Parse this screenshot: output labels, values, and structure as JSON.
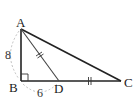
{
  "figure": {
    "vertices": {
      "A": {
        "label": "A",
        "x": 21,
        "y": 29
      },
      "B": {
        "label": "B",
        "x": 21,
        "y": 81
      },
      "C": {
        "label": "C",
        "x": 121,
        "y": 81
      },
      "D": {
        "label": "D",
        "x": 59,
        "y": 81
      }
    },
    "measures": {
      "AB": "8",
      "BD": "6"
    },
    "equal_marks": [
      "AD",
      "DC"
    ],
    "right_angle_at": "B",
    "colors": {
      "line": "#222222",
      "thin_line": "#555555",
      "arc": "#aaaaaa"
    }
  }
}
